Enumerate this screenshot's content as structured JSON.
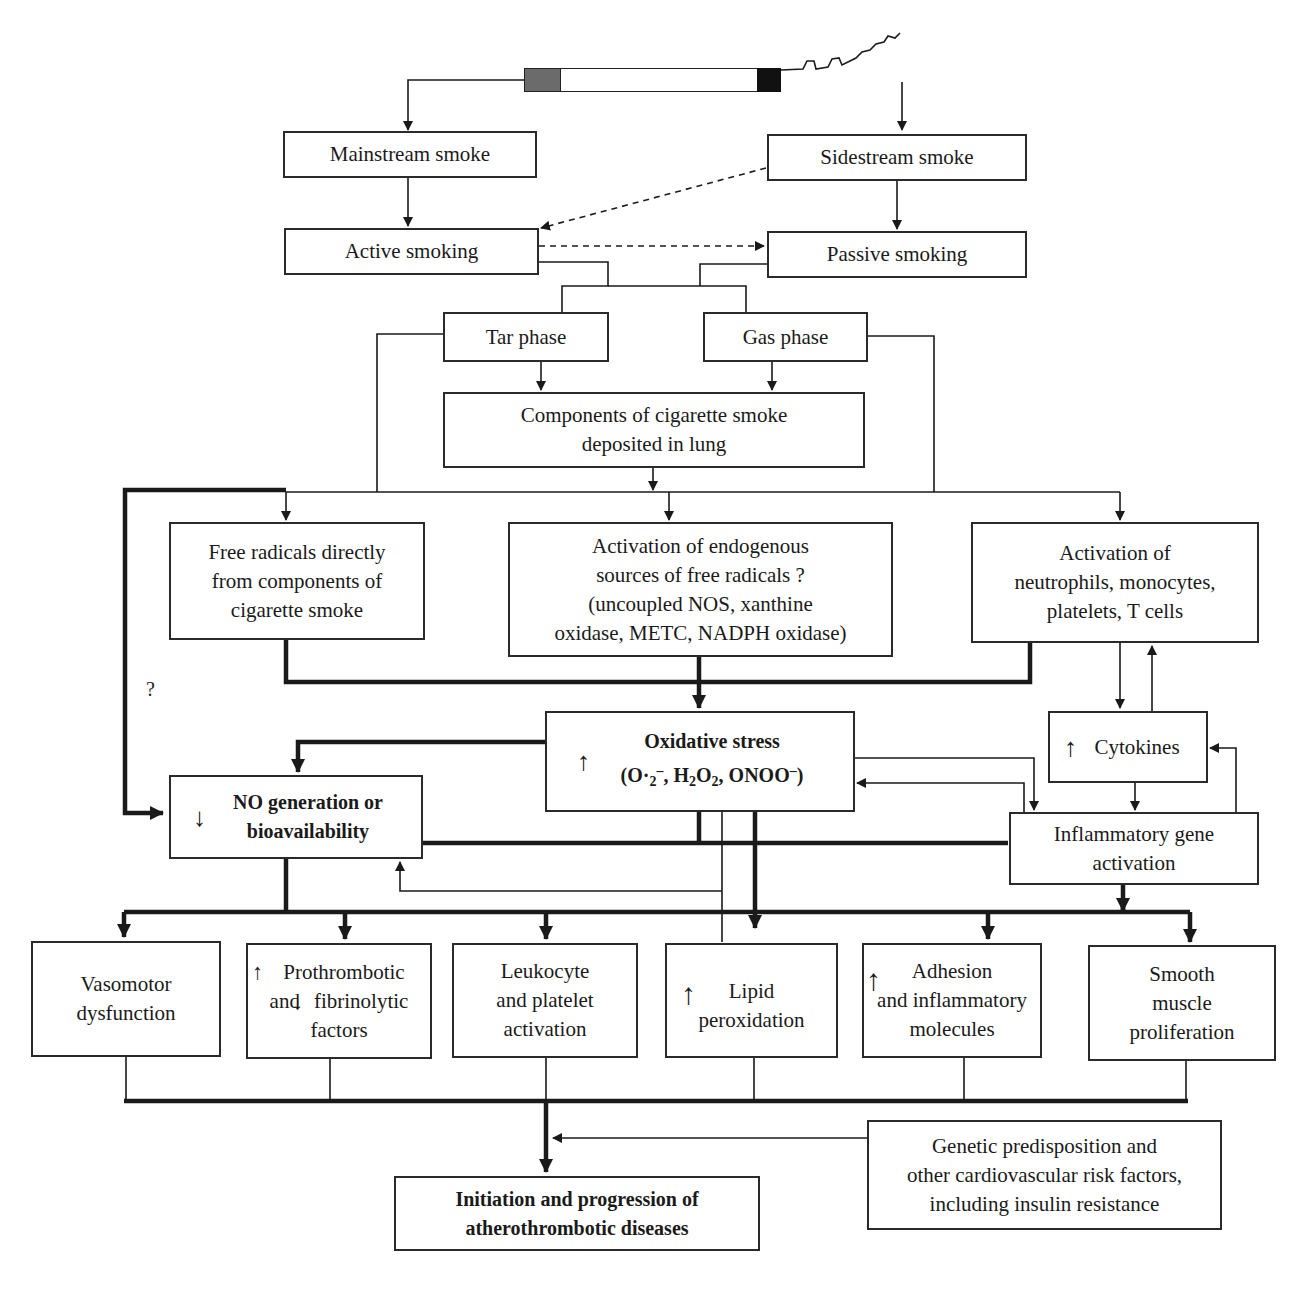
{
  "diagram": {
    "cigarette": {
      "filter_color": "#6b6b6b",
      "tip_color": "#111111"
    },
    "nodes": {
      "mainstream": "Mainstream smoke",
      "sidestream": "Sidestream smoke",
      "active": "Active smoking",
      "passive": "Passive smoking",
      "tar": "Tar phase",
      "gas": "Gas phase",
      "components_line1": "Components of cigarette smoke",
      "components_line2": "deposited in lung",
      "free_radicals_line1": "Free radicals directly",
      "free_radicals_line2": "from components of",
      "free_radicals_line3": "cigarette smoke",
      "endogenous_line1": "Activation of endogenous",
      "endogenous_line2": "sources of free radicals ?",
      "endogenous_line3": "(uncoupled NOS, xanthine",
      "endogenous_line4": "oxidase, METC, NADPH oxidase)",
      "neutrophils_line1": "Activation of",
      "neutrophils_line2": "neutrophils, monocytes,",
      "neutrophils_line3": "platelets, T cells",
      "oxidative_line1": "Oxidative stress",
      "oxidative_open": "(O·",
      "oxidative_sub2a": "2",
      "oxidative_supminus": "–",
      "oxidative_mid": ", H",
      "oxidative_sub2b": "2",
      "oxidative_o": "O",
      "oxidative_sub2c": "2",
      "oxidative_end": ", ONOO",
      "oxidative_sup2": "–",
      "oxidative_close": ")",
      "cytokines": "Cytokines",
      "no_line1": "NO generation or",
      "no_line2": "bioavailability",
      "inflammatory_line1": "Inflammatory gene",
      "inflammatory_line2": "activation",
      "vasomotor_line1": "Vasomotor",
      "vasomotor_line2": "dysfunction",
      "prothrombotic_line1": "Prothrombotic",
      "prothrombotic_line2a": "and",
      "prothrombotic_line2b": "fibrinolytic",
      "prothrombotic_line3": "factors",
      "leukocyte_line1": "Leukocyte",
      "leukocyte_line2": "and platelet",
      "leukocyte_line3": "activation",
      "lipid_line1": "Lipid",
      "lipid_line2": "peroxidation",
      "adhesion_line1": "Adhesion",
      "adhesion_line2": "and inflammatory",
      "adhesion_line3": "molecules",
      "smooth_line1": "Smooth",
      "smooth_line2": "muscle",
      "smooth_line3": "proliferation",
      "genetic_line1": "Genetic predisposition and",
      "genetic_line2": "other cardiovascular risk factors,",
      "genetic_line3": "including insulin resistance",
      "outcome_line1": "Initiation and progression of",
      "outcome_line2": "atherothrombotic diseases"
    },
    "annotations": {
      "question_mark": "?",
      "up_arrow": "↑",
      "down_arrow": "↓"
    }
  }
}
